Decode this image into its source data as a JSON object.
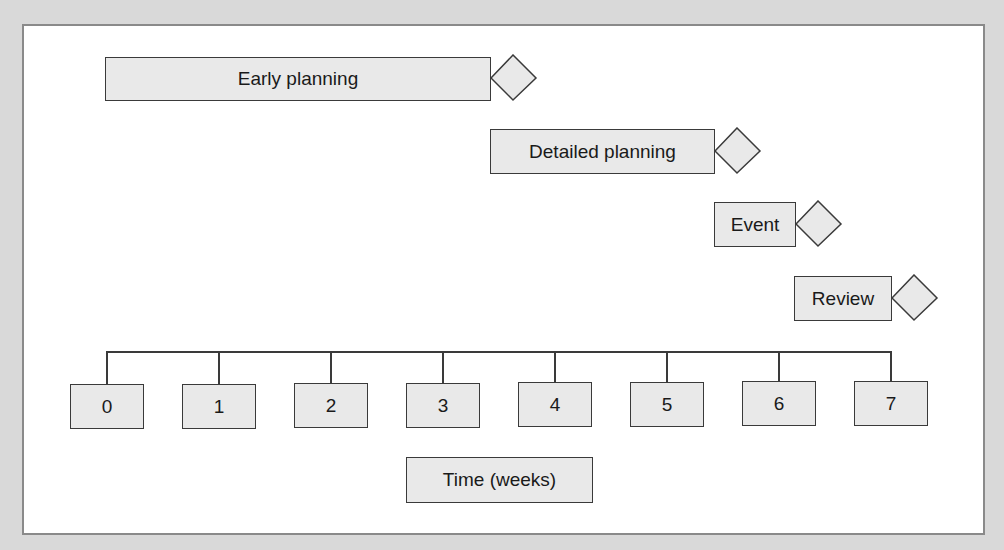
{
  "diagram": {
    "type": "gantt-timeline",
    "background_color": "#d9d9d9",
    "panel_color": "#ffffff",
    "box_fill": "#e9e9e9",
    "stroke_color": "#3a3a3a",
    "tasks": [
      {
        "label": "Early planning",
        "start_week": 0,
        "end_week": 3.5,
        "milestone": "diamond"
      },
      {
        "label": "Detailed planning",
        "start_week": 3.5,
        "end_week": 5.5,
        "milestone": "diamond"
      },
      {
        "label": "Event",
        "start_week": 5.5,
        "end_week": 6.25,
        "milestone": "diamond"
      },
      {
        "label": "Review",
        "start_week": 6.25,
        "end_week": 7,
        "milestone": "diamond"
      }
    ],
    "axis": {
      "ticks": [
        "0",
        "1",
        "2",
        "3",
        "4",
        "5",
        "6",
        "7"
      ],
      "label": "Time (weeks)"
    }
  }
}
